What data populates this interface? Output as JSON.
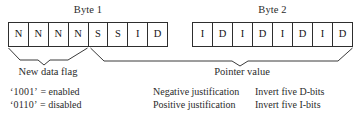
{
  "diagram": {
    "colors": {
      "ink": "#2b2b2b",
      "cell_border": "#2e2e2e",
      "background": "#ffffff",
      "brace_stroke": "#3a3a3a"
    }
  },
  "bytes": [
    {
      "label": "Byte 1",
      "cells": [
        "N",
        "N",
        "N",
        "N",
        "S",
        "S",
        "I",
        "D"
      ]
    },
    {
      "label": "Byte 2",
      "cells": [
        "I",
        "D",
        "I",
        "D",
        "I",
        "D",
        "I",
        "D"
      ]
    }
  ],
  "groups": [
    {
      "caption": "New data flag",
      "spans_cells": "Byte 1 bits 1-4 (N N N N)"
    },
    {
      "caption": "Pointer value",
      "spans_cells": "Byte 1 bits 5-8 through Byte 2 bits 1-8"
    }
  ],
  "notes": {
    "new_data_flag": [
      {
        "code": "‘1001’",
        "equals": "=",
        "meaning": "enabled"
      },
      {
        "code": "‘0110’",
        "equals": "=",
        "meaning": "disabled"
      }
    ],
    "justification": [
      "Negative justification",
      "Positive justification"
    ],
    "invert": [
      "Invert five D-bits",
      "Invert five I-bits"
    ]
  }
}
